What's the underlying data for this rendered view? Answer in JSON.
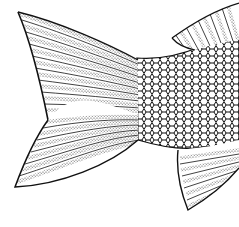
{
  "image": {
    "subject": "Fish tail line drawing",
    "description": "Black-and-white engraving-style illustration of a fish's caudal fin with striped fin rays, scale pattern on the peduncle, and partial dorsal and anal fins",
    "colors": {
      "background": "#ffffff",
      "ink": "#111111",
      "stipple": "#555555"
    },
    "parts": [
      {
        "name": "caudal-fin-upper-lobe"
      },
      {
        "name": "caudal-fin-lower-lobe"
      },
      {
        "name": "caudal-peduncle-scales"
      },
      {
        "name": "dorsal-fin-partial"
      },
      {
        "name": "anal-fin-partial"
      }
    ]
  }
}
